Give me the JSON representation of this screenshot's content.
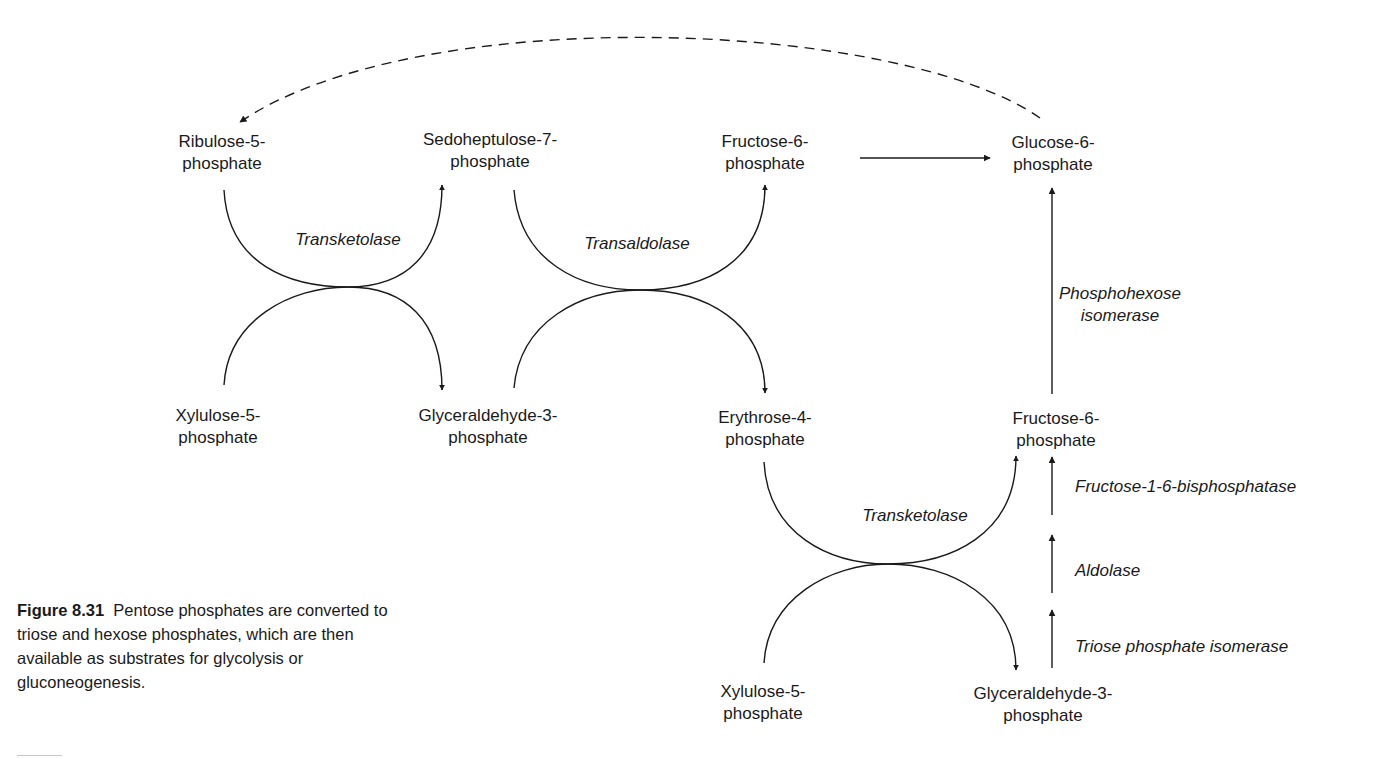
{
  "figure": {
    "caption_label": "Figure 8.31",
    "caption_text": "Pentose phosphates are converted to triose and hexose phosphates, which are then available as substrates for glycolysis or gluconeogenesis."
  },
  "nodes": {
    "ribulose_5p": {
      "line1": "Ribulose-5-",
      "line2": "phosphate"
    },
    "sedoheptulose_7p": {
      "line1": "Sedoheptulose-7-",
      "line2": "phosphate"
    },
    "fructose_6p_top": {
      "line1": "Fructose-6-",
      "line2": "phosphate"
    },
    "glucose_6p": {
      "line1": "Glucose-6-",
      "line2": "phosphate"
    },
    "xylulose_5p_mid": {
      "line1": "Xylulose-5-",
      "line2": "phosphate"
    },
    "glyceraldehyde_3p_mid": {
      "line1": "Glyceraldehyde-3-",
      "line2": "phosphate"
    },
    "erythrose_4p": {
      "line1": "Erythrose-4-",
      "line2": "phosphate"
    },
    "fructose_6p_right": {
      "line1": "Fructose-6-",
      "line2": "phosphate"
    },
    "xylulose_5p_bottom": {
      "line1": "Xylulose-5-",
      "line2": "phosphate"
    },
    "glyceraldehyde_3p_bottom": {
      "line1": "Glyceraldehyde-3-",
      "line2": "phosphate"
    }
  },
  "enzymes": {
    "transketolase_1": "Transketolase",
    "transaldolase": "Transaldolase",
    "transketolase_2": "Transketolase",
    "phosphohexose_isomerase": {
      "line1": "Phosphohexose",
      "line2": "isomerase"
    },
    "fructose_bisphosphatase": "Fructose-1-6-bisphosphatase",
    "aldolase": "Aldolase",
    "triose_phosphate_isomerase": "Triose phosphate isomerase"
  },
  "edges": [
    {
      "from": "Ribulose-5-phosphate + Xylulose-5-phosphate",
      "to": "Sedoheptulose-7-phosphate + Glyceraldehyde-3-phosphate",
      "enzyme": "Transketolase"
    },
    {
      "from": "Sedoheptulose-7-phosphate + Glyceraldehyde-3-phosphate",
      "to": "Fructose-6-phosphate + Erythrose-4-phosphate",
      "enzyme": "Transaldolase"
    },
    {
      "from": "Erythrose-4-phosphate + Xylulose-5-phosphate",
      "to": "Fructose-6-phosphate + Glyceraldehyde-3-phosphate",
      "enzyme": "Transketolase"
    },
    {
      "from": "Fructose-6-phosphate",
      "to": "Glucose-6-phosphate",
      "enzyme": ""
    },
    {
      "from": "Fructose-6-phosphate",
      "to": "Glucose-6-phosphate",
      "enzyme": "Phosphohexose isomerase"
    },
    {
      "from": "Glyceraldehyde-3-phosphate",
      "to": "Fructose-6-phosphate",
      "enzyme": "Triose phosphate isomerase / Aldolase / Fructose-1-6-bisphosphatase"
    },
    {
      "from": "Glucose-6-phosphate",
      "to": "Ribulose-5-phosphate",
      "enzyme": "",
      "style": "dashed"
    }
  ],
  "colors": {
    "line": "#1a1a1a",
    "text": "#1a1a1a",
    "background": "#ffffff"
  }
}
